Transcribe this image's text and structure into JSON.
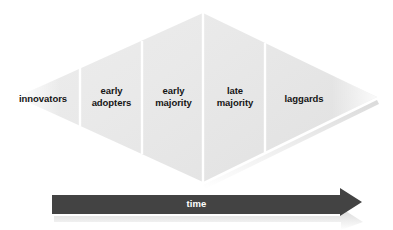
{
  "diagram": {
    "shape": "diamond",
    "colors": {
      "diamond_fill": "#e8e8e8",
      "diamond_fill_light": "#ededed",
      "divider": "#ffffff",
      "label_text": "#151515",
      "arrow_fill": "#434343",
      "arrow_text": "#ffffff",
      "background": "#ffffff"
    },
    "segments": [
      {
        "id": "innovators",
        "label": "innovators",
        "order": 1
      },
      {
        "id": "early-adopters",
        "label": "early\nadopters",
        "order": 2
      },
      {
        "id": "early-majority",
        "label": "early\nmajority",
        "order": 3
      },
      {
        "id": "late-majority",
        "label": "late\nmajority",
        "order": 4
      },
      {
        "id": "laggards",
        "label": "laggards",
        "order": 5
      }
    ],
    "axis": {
      "label": "time",
      "direction": "left-to-right"
    }
  }
}
